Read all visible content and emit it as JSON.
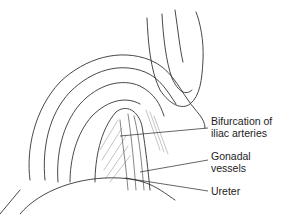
{
  "figure": {
    "labels": [
      {
        "line1": "Bifurcation of",
        "line2": "iliac arteries"
      },
      {
        "line1": "Gonadal",
        "line2": "vessels"
      },
      {
        "line1": "Ureter",
        "line2": ""
      }
    ],
    "colors": {
      "ink": "#222222",
      "background": "#ffffff"
    }
  }
}
